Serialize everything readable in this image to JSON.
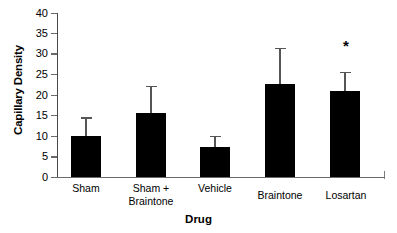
{
  "chart_data": {
    "type": "bar",
    "title": "",
    "xlabel": "Drug",
    "ylabel": "Capillary Density",
    "categories": [
      "Sham",
      "Sham + Braintone",
      "Vehicle",
      "Braintone",
      "Losartan"
    ],
    "category_lines": [
      [
        "Sham"
      ],
      [
        "Sham +",
        "Braintone"
      ],
      [
        "Vehicle"
      ],
      [
        "Braintone"
      ],
      [
        "Losartan"
      ]
    ],
    "values": [
      10,
      15.5,
      7.3,
      22.8,
      21
    ],
    "errors": [
      4.6,
      6.7,
      2.7,
      8.7,
      4.6
    ],
    "error_type": "upper-only",
    "ylim": [
      0,
      40
    ],
    "yticks": [
      0,
      5,
      10,
      15,
      20,
      25,
      30,
      35,
      40
    ],
    "ytick_labels": [
      "0",
      "5",
      "10",
      "15",
      "20",
      "25",
      "30",
      "35",
      "40"
    ],
    "grid": false,
    "legend": null,
    "bar_color": "#000000",
    "annotations": [
      {
        "text": "*",
        "category": "Losartan",
        "y": 31.5,
        "meaning": "significant"
      }
    ]
  },
  "axis": {
    "y_label_text": "Capillary Density",
    "x_label_text": "Drug"
  }
}
